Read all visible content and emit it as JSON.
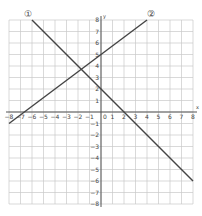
{
  "chart_data": {
    "type": "line",
    "title": "",
    "xlabel": "x",
    "ylabel": "y",
    "origin_label": "0",
    "xlim": [
      -8,
      8
    ],
    "ylim": [
      -8,
      8
    ],
    "grid": true,
    "x_ticks": [
      -8,
      -7,
      -6,
      -5,
      -4,
      -3,
      -2,
      -1,
      1,
      2,
      3,
      4,
      5,
      6,
      7,
      8
    ],
    "y_ticks": [
      8,
      7,
      6,
      5,
      4,
      3,
      2,
      1,
      -1,
      -2,
      -3,
      -4,
      -5,
      -6,
      -7,
      -8
    ],
    "series": [
      {
        "name": "①",
        "equation": "y = -x + 2",
        "x": [
          -6,
          8
        ],
        "y": [
          8,
          -6
        ]
      },
      {
        "name": "②",
        "equation": "y = 3/4 x + 5",
        "x": [
          -8,
          4
        ],
        "y": [
          -1,
          8
        ]
      }
    ],
    "colors": {
      "grid": "#c8c8c8",
      "axis": "#555555",
      "line": "#444444"
    }
  }
}
